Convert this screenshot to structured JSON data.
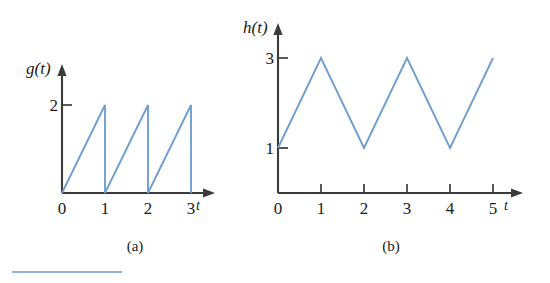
{
  "figure": {
    "background_color": "#ffffff",
    "line_color": "#6f9fd0",
    "axis_color": "#3b3b3b",
    "rule_color": "#8fb4d9"
  },
  "panels": [
    {
      "caption": "(a)",
      "y_axis_label": "g(t)",
      "x_axis_label": "t",
      "x_tick_labels": [
        "0",
        "1",
        "2",
        "3"
      ],
      "y_tick_labels": [
        "2"
      ]
    },
    {
      "caption": "(b)",
      "y_axis_label": "h(t)",
      "x_axis_label": "t",
      "x_tick_labels": [
        "0",
        "1",
        "2",
        "3",
        "4",
        "5"
      ],
      "y_tick_labels": [
        "1",
        "3"
      ]
    }
  ],
  "chart_data": [
    {
      "type": "line",
      "title": "(a)",
      "xlabel": "t",
      "ylabel": "g(t)",
      "xlim": [
        0,
        3.35
      ],
      "ylim": [
        0,
        2.45
      ],
      "grid": false,
      "legend": "none",
      "xticks": [
        0,
        1,
        2,
        3
      ],
      "yticks": [
        2
      ],
      "description": "Sawtooth wave: g(t) rises linearly from 0 to 2 on each unit interval then drops vertically back to 0 at t = 1, 2, 3.",
      "series": [
        {
          "name": "g(t)",
          "color": "#6f9fd0",
          "x": [
            0,
            1,
            1,
            2,
            2,
            3,
            3
          ],
          "y": [
            0,
            2,
            0,
            2,
            0,
            2,
            0
          ]
        }
      ]
    },
    {
      "type": "line",
      "title": "(b)",
      "xlabel": "t",
      "ylabel": "h(t)",
      "xlim": [
        0,
        5.35
      ],
      "ylim": [
        0,
        3.45
      ],
      "grid": false,
      "legend": "none",
      "xticks": [
        0,
        1,
        2,
        3,
        4,
        5
      ],
      "yticks": [
        1,
        3
      ],
      "description": "Triangular wave: h(t) starts at 1, rises to 3 at t = 1, falls to 1 at t = 2, rises to 3 at t = 3, falls to 1 at t = 4, rises to 3 at t = 5.",
      "series": [
        {
          "name": "h(t)",
          "color": "#6f9fd0",
          "x": [
            0,
            1,
            2,
            3,
            4,
            5
          ],
          "y": [
            1,
            3,
            1,
            3,
            1,
            3
          ]
        }
      ]
    }
  ]
}
